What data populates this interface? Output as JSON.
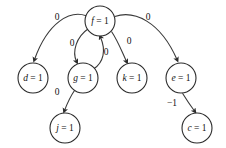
{
  "figure": {
    "type": "directed-graph",
    "background_color": "#ffffff",
    "stroke_color": "#2b2b2b",
    "text_color": "#111111",
    "width": 226,
    "height": 148
  },
  "graph": {
    "nodes": [
      {
        "id": "f",
        "label": "f = 1",
        "var": "f",
        "value": "1",
        "cx": 100,
        "cy": 21,
        "r": 15
      },
      {
        "id": "d",
        "label": "d = 1",
        "var": "d",
        "value": "1",
        "cx": 33,
        "cy": 78,
        "r": 15
      },
      {
        "id": "g",
        "label": "g = 1",
        "var": "g",
        "value": "1",
        "cx": 83,
        "cy": 78,
        "r": 15
      },
      {
        "id": "k",
        "label": "k = 1",
        "var": "k",
        "value": "1",
        "cx": 132,
        "cy": 78,
        "r": 15
      },
      {
        "id": "e",
        "label": "e = 1",
        "var": "e",
        "value": "1",
        "cx": 181,
        "cy": 78,
        "r": 15
      },
      {
        "id": "j",
        "label": "j = 1",
        "var": "j",
        "value": "1",
        "cx": 65,
        "cy": 128,
        "r": 15
      },
      {
        "id": "c",
        "label": "c = 1",
        "var": "c",
        "value": "1",
        "cx": 197,
        "cy": 128,
        "r": 15
      }
    ],
    "edges": [
      {
        "id": "f-d",
        "from": "f",
        "to": "d",
        "weight": "0",
        "label_x": 57,
        "label_y": 18,
        "path": "M 86.2 15.8 C 70 10 48 22 34.5 59.5"
      },
      {
        "id": "f-g",
        "from": "f",
        "to": "g",
        "weight": "0",
        "label_x": 72,
        "label_y": 44,
        "path": "M 88.6 28.5 C 76 37 72 52 76.5 61.5"
      },
      {
        "id": "g-f",
        "from": "g",
        "to": "f",
        "weight": "0",
        "label_x": 106,
        "label_y": 53,
        "path": "M 93.5 69 C 104 62 106 50 100.5 37.2"
      },
      {
        "id": "f-k",
        "from": "f",
        "to": "k",
        "weight": "0",
        "label_x": 129,
        "label_y": 42,
        "path": "M 111.5 31.5 C 118 41 122 52 126.5 61.5"
      },
      {
        "id": "f-e",
        "from": "f",
        "to": "e",
        "weight": "0",
        "label_x": 148,
        "label_y": 18,
        "path": "M 114.8 16.5 C 134 10 160 21 177 59.5"
      },
      {
        "id": "g-j",
        "from": "g",
        "to": "j",
        "weight": "0",
        "label_x": 57,
        "label_y": 93,
        "path": "M 74.5 90.5 C 70 97 67 104 64.5 110.5"
      },
      {
        "id": "e-c",
        "from": "e",
        "to": "c",
        "weight": "−1",
        "label_x": 172,
        "label_y": 104,
        "path": "M 182.5 93.3 C 186 99 190 105 194.5 111"
      }
    ]
  }
}
